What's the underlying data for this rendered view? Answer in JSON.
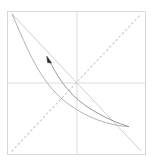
{
  "figure": {
    "title": "",
    "width": 153,
    "height": 166,
    "background_color": "#ffffff"
  },
  "chart_data": {
    "type": "line",
    "title": "",
    "subtitle": "",
    "xlabel": "",
    "ylabel": "",
    "xlim": [
      -1,
      1
    ],
    "ylim": [
      -1,
      1
    ],
    "grid": true,
    "legend": false,
    "legend_position": "none",
    "tick_labels": {
      "x": [],
      "y": []
    },
    "annotations": [
      {
        "name": "arrowhead-marker",
        "kind": "arrow",
        "x": 50,
        "y": 61,
        "direction": "up-left",
        "color": "#2b2b2b",
        "label": ""
      }
    ],
    "series": [
      {
        "name": "anti-diagonal-line",
        "style": "solid",
        "color": "#c9c9c9",
        "width": 0.8,
        "points": [
          [
            12,
            14
          ],
          [
            141,
            151
          ]
        ]
      },
      {
        "name": "main-diagonal-dotted",
        "style": "dotted",
        "color": "#cfcfcf",
        "width": 1.0,
        "points": [
          [
            12,
            151
          ],
          [
            141,
            14
          ]
        ]
      },
      {
        "name": "outer-arc",
        "style": "solid",
        "color": "#a9a9a9",
        "width": 0.8,
        "points": [
          [
            12,
            14
          ],
          [
            30,
            46
          ],
          [
            52,
            78
          ],
          [
            82,
            106
          ],
          [
            112,
            121
          ],
          [
            128,
            126
          ]
        ]
      },
      {
        "name": "inner-arc",
        "style": "solid",
        "color": "#8f8f8f",
        "width": 0.8,
        "points": [
          [
            47,
            57
          ],
          [
            58,
            76
          ],
          [
            75,
            96
          ],
          [
            98,
            113
          ],
          [
            118,
            123
          ],
          [
            128,
            126
          ]
        ]
      }
    ],
    "gridlines": {
      "vertical_x": 77,
      "horizontal_y": 83,
      "color": "#d9d9d9"
    },
    "frame": {
      "x": 7,
      "y": 11,
      "width": 139,
      "height": 144,
      "color": "#d6d6d6"
    }
  },
  "colors": {
    "frame": "#d6d6d6",
    "grid": "#dcdcdc",
    "diagonal_solid": "#c9c9c9",
    "diagonal_dotted": "#cdcdcd",
    "curve_outer": "#a8a8a8",
    "curve_inner": "#8c8c8c",
    "arrow": "#2b2b2b",
    "background": "#ffffff"
  },
  "accessibility": {
    "figure_description": "Geometric diagram: square plot frame with center crosshair, a solid descending diagonal, a dotted ascending diagonal, and two converging arcs with an arrowhead"
  }
}
